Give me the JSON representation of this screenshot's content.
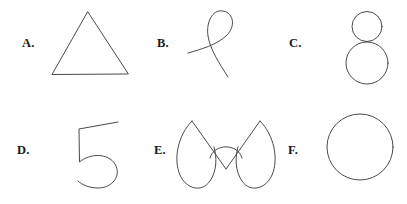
{
  "figure": {
    "title": "",
    "background_color": "#ffffff",
    "stroke_color": "#4a4a4a",
    "label_color": "#1a1a1a",
    "rows": 2,
    "columns": 3
  },
  "panels": [
    {
      "label": "A.",
      "shape_name": "triangle",
      "description": "equilateral triangle outline"
    },
    {
      "label": "B.",
      "shape_name": "loop-curve",
      "description": "open ribbon loop with a single self-crossing"
    },
    {
      "label": "C.",
      "shape_name": "double-circle",
      "description": "small circle tangent above a larger circle, figure-eight"
    },
    {
      "label": "D.",
      "shape_name": "digit-five",
      "description": "open curve resembling the numeral five"
    },
    {
      "label": "E.",
      "shape_name": "butterfly",
      "description": "symmetric butterfly with two teardrop lobes and a central V"
    },
    {
      "label": "F.",
      "shape_name": "circle",
      "description": "single closed circle outline"
    }
  ]
}
